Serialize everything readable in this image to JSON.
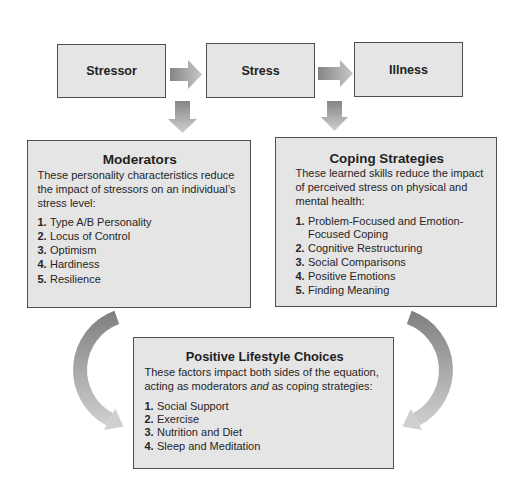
{
  "flow": {
    "stressor": "Stressor",
    "stress": "Stress",
    "illness": "Illness"
  },
  "moderators": {
    "title": "Moderators",
    "description_lines": [
      "These personality characteristics reduce",
      "the impact of stressors on an individual’s",
      "stress level:"
    ],
    "items": [
      {
        "num": "1.",
        "text": "Type A/B Personality"
      },
      {
        "num": "2.",
        "text": "Locus of Control"
      },
      {
        "num": "3.",
        "text": "Optimism"
      },
      {
        "num": "4.",
        "text": "Hardiness"
      },
      {
        "num": "5.",
        "text": "Resilience"
      }
    ]
  },
  "coping": {
    "title": "Coping Strategies",
    "description_lines": [
      "These learned skills reduce the impact",
      "of perceived stress on physical and",
      "mental health:"
    ],
    "items": [
      {
        "num": "1.",
        "text": "Problem-Focused and Emotion-Focused Coping"
      },
      {
        "num": "2.",
        "text": "Cognitive Restructuring"
      },
      {
        "num": "3.",
        "text": "Social Comparisons"
      },
      {
        "num": "4.",
        "text": "Positive Emotions"
      },
      {
        "num": "5.",
        "text": "Finding Meaning"
      }
    ]
  },
  "lifestyle": {
    "title": "Positive Lifestyle Choices",
    "description_line1": "These factors impact both sides of the equation,",
    "description_line2": {
      "before": "acting as moderators ",
      "emphasis": "and",
      "after": " as coping strategies:"
    },
    "items": [
      {
        "num": "1.",
        "text": "Social Support"
      },
      {
        "num": "2.",
        "text": "Exercise"
      },
      {
        "num": "3.",
        "text": "Nutrition and Diet"
      },
      {
        "num": "4.",
        "text": "Sleep and Meditation"
      }
    ]
  },
  "colors": {
    "box_fill": "#e5e5e5",
    "box_border": "#4e4e4e",
    "arrow_dark": "#858585",
    "arrow_light": "#d0d0d0",
    "text": "#262626"
  }
}
